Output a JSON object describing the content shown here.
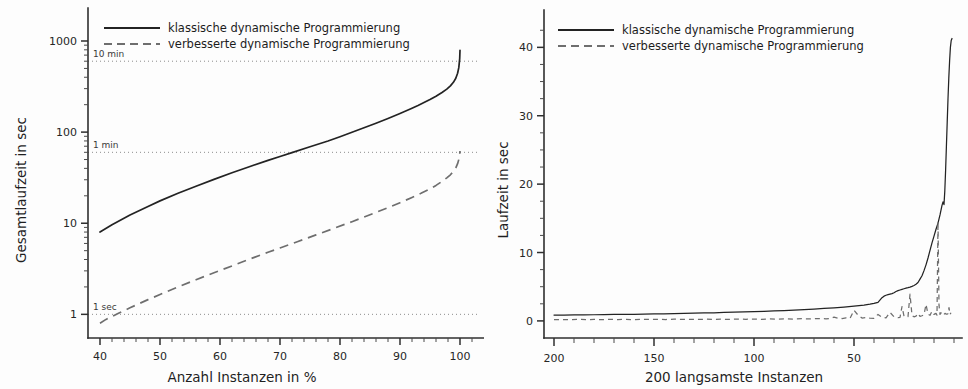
{
  "figure": {
    "background": "#fdfdfd",
    "ink": "#232323",
    "secondary_ink": "#6e6e6e",
    "panel_count": 2
  },
  "chart_data": [
    {
      "id": "left",
      "type": "line",
      "title": "",
      "xlabel": "Anzahl Instanzen in %",
      "ylabel": "Gesamtlaufzeit in sec",
      "xscale": "linear",
      "yscale": "log",
      "xlim": [
        38,
        103
      ],
      "ylim": [
        0.55,
        1700
      ],
      "grid": false,
      "xticks": [
        40,
        50,
        60,
        70,
        80,
        90,
        100
      ],
      "xticklabels": [
        "40",
        "50",
        "60",
        "70",
        "80",
        "90",
        "100"
      ],
      "yticks": [
        1,
        10,
        100,
        1000
      ],
      "yticklabels": [
        "1",
        "10",
        "100",
        "1000"
      ],
      "yminor": [
        2,
        3,
        4,
        5,
        6,
        7,
        8,
        9,
        20,
        30,
        40,
        50,
        60,
        70,
        80,
        90,
        200,
        300,
        400,
        500,
        600,
        700,
        800,
        900,
        2000
      ],
      "legend_position": "upper-left",
      "annotations": [
        {
          "label": "10 min",
          "y": 600,
          "style": "dotted-hline"
        },
        {
          "label": "1 min",
          "y": 60,
          "style": "dotted-hline"
        },
        {
          "label": "1 sec",
          "y": 1,
          "style": "dotted-hline"
        }
      ],
      "series": [
        {
          "name": "klassische dynamische Programmierung",
          "style": "solid",
          "x": [
            40,
            42,
            45,
            48,
            50,
            53,
            56,
            59,
            62,
            65,
            68,
            70,
            72,
            75,
            78,
            80,
            82,
            84,
            86,
            88,
            90,
            92,
            93,
            94,
            95,
            96,
            97,
            97.8,
            98.4,
            98.9,
            99.3,
            99.6,
            99.8,
            99.95,
            100
          ],
          "y": [
            8.0,
            9.6,
            12.3,
            15.3,
            17.6,
            21.3,
            25.5,
            30.3,
            35.8,
            42.0,
            49.0,
            54.0,
            59.5,
            69.0,
            80.0,
            89.0,
            99.5,
            111.5,
            125.0,
            141.0,
            160.0,
            183.0,
            196.0,
            211.0,
            228.0,
            248.0,
            272.0,
            296.0,
            322.0,
            352.0,
            390.0,
            442.0,
            510.0,
            640.0,
            790.0
          ]
        },
        {
          "name": "verbesserte dynamische Programmierung",
          "style": "dashed",
          "x": [
            40,
            41,
            43,
            45,
            48,
            50,
            53,
            56,
            59,
            62,
            65,
            68,
            70,
            73,
            76,
            79,
            82,
            85,
            88,
            90,
            92,
            93.5,
            95,
            96,
            97,
            97.8,
            98.4,
            98.9,
            99.3,
            99.6,
            99.8,
            99.95,
            100
          ],
          "y": [
            0.8,
            0.88,
            1.02,
            1.18,
            1.45,
            1.65,
            2.0,
            2.4,
            2.86,
            3.4,
            4.05,
            4.8,
            5.35,
            6.3,
            7.45,
            8.8,
            10.4,
            12.4,
            14.8,
            16.8,
            19.2,
            21.3,
            23.8,
            26.0,
            28.8,
            31.5,
            34.0,
            37.0,
            40.5,
            45.0,
            50.0,
            57.0,
            62.0
          ]
        }
      ]
    },
    {
      "id": "right",
      "type": "line",
      "title": "",
      "xlabel": "200 langsamste Instanzen",
      "ylabel": "Laufzeit in sec",
      "xscale": "linear-reversed",
      "yscale": "linear",
      "xlim": [
        205,
        0
      ],
      "ylim": [
        -2.5,
        44
      ],
      "grid": false,
      "xticks": [
        200,
        150,
        100,
        50
      ],
      "xticklabels": [
        "200",
        "150",
        "100",
        "50"
      ],
      "yticks": [
        0,
        10,
        20,
        30,
        40
      ],
      "yticklabels": [
        "0",
        "10",
        "20",
        "30",
        "40"
      ],
      "yminor": [
        2.5,
        5,
        7.5,
        12.5,
        15,
        17.5,
        22.5,
        25,
        27.5,
        32.5,
        35,
        37.5,
        42.5
      ],
      "legend_position": "upper-left",
      "annotations": [],
      "series": [
        {
          "name": "klassische dynamische Programmierung",
          "style": "solid",
          "x": [
            200,
            195,
            190,
            185,
            180,
            175,
            170,
            165,
            160,
            155,
            150,
            145,
            140,
            135,
            130,
            125,
            120,
            115,
            110,
            105,
            100,
            95,
            90,
            85,
            80,
            75,
            70,
            65,
            60,
            55,
            50,
            45,
            42,
            40,
            38,
            36,
            35,
            34,
            33,
            32,
            31,
            30,
            29,
            28,
            27,
            26,
            25,
            24,
            23,
            22,
            21,
            20,
            19,
            18,
            17,
            16,
            15,
            14,
            13,
            12,
            11,
            10,
            9,
            8,
            7,
            6.5,
            6,
            5.5,
            5,
            4.6,
            4.2,
            3.8,
            3.4,
            3.0,
            2.6,
            2.2,
            1.8,
            1.4,
            1.0
          ],
          "y": [
            0.85,
            0.86,
            0.88,
            0.89,
            0.9,
            0.92,
            0.94,
            0.95,
            0.97,
            0.99,
            1.02,
            1.04,
            1.07,
            1.1,
            1.13,
            1.16,
            1.19,
            1.23,
            1.27,
            1.31,
            1.36,
            1.41,
            1.46,
            1.52,
            1.58,
            1.65,
            1.73,
            1.82,
            1.92,
            2.03,
            2.16,
            2.32,
            2.44,
            2.55,
            2.72,
            3.4,
            3.62,
            3.75,
            3.84,
            3.92,
            4.0,
            4.12,
            4.3,
            4.42,
            4.52,
            4.62,
            4.7,
            4.78,
            4.86,
            4.95,
            5.05,
            5.18,
            5.35,
            5.62,
            6.1,
            6.6,
            7.35,
            8.2,
            9.2,
            10.3,
            11.4,
            12.4,
            13.4,
            14.3,
            15.5,
            16.2,
            16.9,
            17.4,
            17.0,
            19.0,
            22.0,
            25.5,
            29.0,
            32.5,
            35.5,
            38.0,
            40.0,
            41.0,
            41.3
          ]
        },
        {
          "name": "verbesserte dynamische Programmierung",
          "style": "dashed",
          "x": [
            200,
            196,
            192,
            188,
            184,
            180,
            176,
            172,
            168,
            164,
            160,
            156,
            152,
            148,
            144,
            140,
            136,
            132,
            128,
            124,
            120,
            116,
            112,
            108,
            104,
            100,
            96,
            92,
            88,
            84,
            80,
            76,
            72,
            68,
            64,
            62,
            60,
            58,
            56,
            54,
            52,
            50,
            48,
            46,
            44,
            42,
            40,
            38,
            36,
            34,
            32,
            30,
            28,
            27,
            26,
            25,
            24,
            23,
            22,
            21,
            20,
            19,
            18,
            17,
            16,
            15,
            14,
            13,
            12,
            11,
            10,
            9,
            8.5,
            8,
            7.5,
            7,
            6.5,
            6,
            5.5,
            5,
            4.5,
            4,
            3.5,
            3,
            2.5,
            2,
            1.5,
            1
          ],
          "y": [
            0.18,
            0.2,
            0.17,
            0.22,
            0.19,
            0.21,
            0.18,
            0.23,
            0.2,
            0.22,
            0.19,
            0.24,
            0.21,
            0.23,
            0.2,
            0.25,
            0.22,
            0.24,
            0.21,
            0.26,
            0.23,
            0.25,
            0.22,
            0.27,
            0.24,
            0.26,
            0.23,
            0.28,
            0.25,
            0.3,
            0.27,
            0.32,
            0.29,
            0.34,
            0.31,
            0.36,
            0.55,
            0.4,
            0.35,
            0.45,
            0.38,
            1.55,
            0.85,
            0.42,
            0.5,
            0.4,
            0.38,
            0.95,
            0.52,
            0.45,
            1.25,
            0.6,
            0.48,
            0.52,
            2.1,
            0.7,
            0.55,
            0.62,
            3.9,
            0.8,
            0.6,
            0.7,
            1.1,
            0.66,
            0.75,
            0.9,
            2.4,
            1.0,
            0.82,
            1.4,
            0.95,
            1.1,
            0.85,
            14.5,
            2.3,
            0.95,
            1.2,
            0.9,
            1.05,
            0.95,
            1.1,
            1.0,
            0.98,
            1.05,
            1.95,
            0.95,
            1.2
          ]
        }
      ]
    }
  ],
  "legend": {
    "entries": [
      {
        "label": "klassische dynamische Programmierung",
        "style": "solid"
      },
      {
        "label": "verbesserte dynamische Programmierung",
        "style": "dashed"
      }
    ]
  },
  "left_panel": {
    "ylabel": "Gesamtlaufzeit in sec",
    "xlabel": "Anzahl Instanzen in %",
    "xticklabels": [
      "40",
      "50",
      "60",
      "70",
      "80",
      "90",
      "100"
    ],
    "yticklabels": [
      "1000",
      "100",
      "10",
      "1"
    ],
    "reflabels": [
      "10 min",
      "1 min",
      "1 sec"
    ],
    "legend": [
      "klassische dynamische Programmierung",
      "verbesserte dynamische Programmierung"
    ]
  },
  "right_panel": {
    "ylabel": "Laufzeit in sec",
    "xlabel": "200 langsamste Instanzen",
    "xticklabels": [
      "200",
      "150",
      "100",
      "50"
    ],
    "yticklabels": [
      "40",
      "30",
      "20",
      "10",
      "0"
    ],
    "legend": [
      "klassische dynamische Programmierung",
      "verbesserte dynamische Programmierung"
    ]
  }
}
